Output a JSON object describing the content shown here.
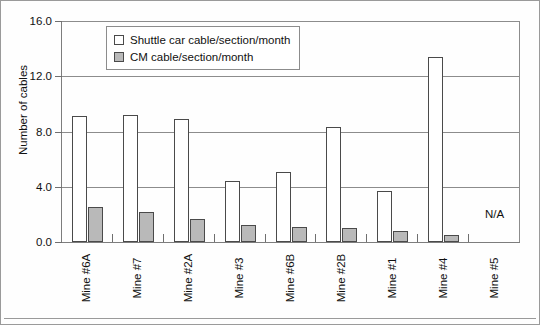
{
  "chart_data": {
    "type": "bar",
    "title": "",
    "xlabel": "",
    "ylabel": "Number of cables",
    "ylim": [
      0,
      16
    ],
    "yticks": [
      "0.0",
      "4.0",
      "8.0",
      "12.0",
      "16.0"
    ],
    "ytick_values": [
      0,
      4,
      8,
      12,
      16
    ],
    "grid": true,
    "legend_position": "upper-left-inside",
    "categories": [
      "Mine #6A",
      "Mine #7",
      "Mine #2A",
      "Mine #3",
      "Mine #6B",
      "Mine #2B",
      "Mine #1",
      "Mine #4",
      "Mine #5"
    ],
    "series": [
      {
        "name": "Shuttle car cable/section/month",
        "color": "#ffffff",
        "values": [
          9.1,
          9.2,
          8.9,
          4.4,
          5.1,
          8.3,
          3.7,
          13.4,
          null
        ]
      },
      {
        "name": "CM cable/section/month",
        "color": "#b9b9b9",
        "values": [
          2.5,
          2.2,
          1.7,
          1.2,
          1.1,
          1.0,
          0.8,
          0.5,
          null
        ]
      }
    ],
    "annotations": [
      {
        "category": "Mine #5",
        "text": "N/A"
      }
    ]
  },
  "legend": {
    "items": [
      {
        "label": "Shuttle car cable/section/month",
        "swatch": "shuttle"
      },
      {
        "label": "CM cable/section/month",
        "swatch": "cm"
      }
    ]
  },
  "axis": {
    "y_title": "Number of cables",
    "y_ticks": [
      "16.0",
      "12.0",
      "8.0",
      "4.0",
      "0.0"
    ]
  },
  "colors": {
    "shuttle_fill": "#ffffff",
    "cm_fill": "#b9b9b9",
    "bar_stroke": "#4a4a4a",
    "grid": "#8c8c8c",
    "axis": "#6f6f6f",
    "frame": "#9a9a9a"
  }
}
